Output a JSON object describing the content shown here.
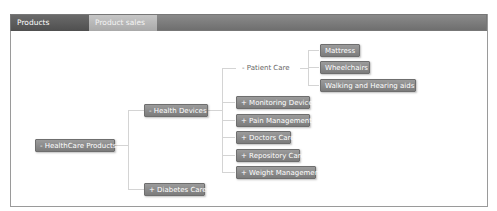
{
  "tabs": [
    {
      "label": "Products Hierarchy",
      "active": true
    },
    {
      "label": "Product sales",
      "active": false
    }
  ],
  "tree": {
    "root": "- HealthCare Products",
    "level1": {
      "health_devices": "- Health Devices",
      "diabetes_care": "+ Diabetes Care"
    },
    "level2": {
      "patient_care": "- Patient Care",
      "monitoring_devices": "+ Monitoring Devices",
      "pain_managements": "+ Pain Managements",
      "doctors_care": "+ Doctors Care",
      "repository_care": "+ Repository Care",
      "weight_management": "+ Weight Management"
    },
    "level3": {
      "mattress": "Mattress",
      "wheelchairs": "Wheelchairs",
      "walking_hearing_aids": "Walking and Hearing aids"
    }
  },
  "colors": {
    "node_bg": "#8a8a8a",
    "tabbar_bg": "#7a7a7a",
    "connector": "#d4d4d4"
  }
}
